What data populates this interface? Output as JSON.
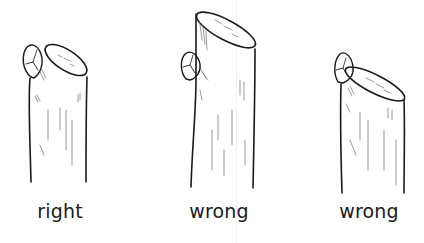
{
  "figure": {
    "ink_color": "#1a1a1a",
    "panels": [
      {
        "label": "right",
        "verdict": "correct"
      },
      {
        "label": "wrong",
        "verdict": "incorrect"
      },
      {
        "label": "wrong",
        "verdict": "incorrect"
      }
    ]
  }
}
